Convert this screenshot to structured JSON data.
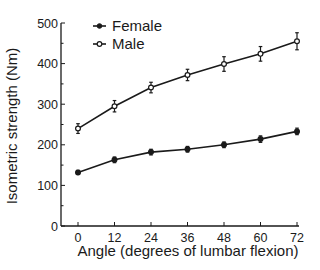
{
  "chart_data": {
    "type": "line",
    "title": "",
    "xlabel": "Angle (degrees of lumbar flexion)",
    "ylabel": "Isometric strength (Nm)",
    "x": [
      0,
      12,
      24,
      36,
      48,
      60,
      72
    ],
    "xticks": [
      "0",
      "12",
      "24",
      "36",
      "48",
      "60",
      "72"
    ],
    "yticks": [
      "0",
      "100",
      "200",
      "300",
      "400",
      "500"
    ],
    "xlim": [
      0,
      72
    ],
    "ylim": [
      0,
      500
    ],
    "grid": false,
    "legend_position": "top-left",
    "series": [
      {
        "name": "Female",
        "marker": "filled-circle",
        "values": [
          132,
          163,
          182,
          189,
          200,
          214,
          233
        ],
        "errors": [
          5,
          7,
          7,
          7,
          7,
          8,
          8
        ]
      },
      {
        "name": "Male",
        "marker": "open-circle",
        "values": [
          240,
          295,
          341,
          372,
          399,
          424,
          455
        ],
        "errors": [
          12,
          14,
          13,
          14,
          18,
          18,
          21
        ]
      }
    ],
    "colors": {
      "line": "#1a1a1a"
    }
  }
}
